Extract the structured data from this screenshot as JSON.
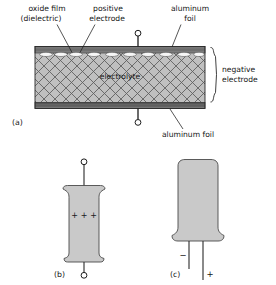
{
  "figure": {
    "panels": [
      {
        "id": "a",
        "label": "(a)",
        "caption": "cross-section of foil/electrolyte stack"
      },
      {
        "id": "b",
        "label": "(b)",
        "caption": "axial-lead electrolytic capacitor"
      },
      {
        "id": "c",
        "label": "(c)",
        "caption": "radial-lead electrolytic capacitor"
      }
    ],
    "callouts": [
      {
        "name": "oxide-film",
        "line1": "oxide film",
        "line2": "(dielectric)"
      },
      {
        "name": "positive-electrode",
        "line1": "positive",
        "line2": "electrode"
      },
      {
        "name": "aluminum-foil-top",
        "line1": "aluminum",
        "line2": "foil"
      },
      {
        "name": "negative-electrode",
        "line1": "negative",
        "line2": "electrode"
      },
      {
        "name": "aluminum-foil-bottom",
        "line1": "aluminum  foil",
        "line2": ""
      }
    ],
    "body_label": "electrolyte",
    "polarity": {
      "axial_marks": "+  +  +",
      "axial_mark_single": "+",
      "axial_mark_count": 3,
      "radial_negative": "−",
      "radial_positive": "+"
    },
    "colors": {
      "background": "#ffffff",
      "electrolyte_fill": "#c0c0c0",
      "hatch_stroke": "#595959",
      "foil_dark": "#5a5a5a",
      "foil_mid": "#8a8a8a",
      "oxide_white": "#f4f4f4",
      "case_fill": "#c9c9c9",
      "case_stroke": "#4a4a4a",
      "ink": "#151515"
    }
  }
}
